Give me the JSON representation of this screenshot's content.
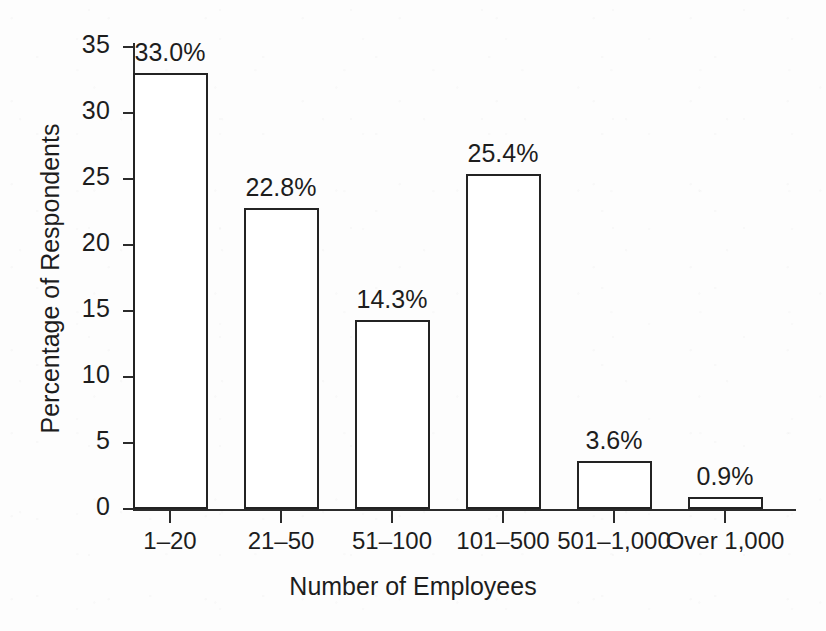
{
  "chart_data": {
    "type": "bar",
    "title": "",
    "xlabel": "Number of Employees",
    "ylabel": "Percentage of Respondents",
    "categories": [
      "1–20",
      "21–50",
      "51–100",
      "101–500",
      "501–1,000",
      "Over 1,000"
    ],
    "values": [
      33.0,
      22.8,
      14.3,
      25.4,
      3.6,
      0.9
    ],
    "value_labels": [
      "33.0%",
      "22.8%",
      "14.3%",
      "25.4%",
      "3.6%",
      "0.9%"
    ],
    "ylim": [
      0,
      35
    ],
    "xlim": null,
    "yticks": [
      0,
      5,
      10,
      15,
      20,
      25,
      30,
      35
    ],
    "ytick_labels": [
      "0",
      "5",
      "10",
      "15",
      "20",
      "25",
      "30",
      "35"
    ],
    "grid": false,
    "legend": null,
    "legend_position": "none",
    "bar_fill": "#ffffff",
    "bar_edge": "#232323",
    "axis_color": "#2b2b2b",
    "text_color": "#1d1d1d",
    "background": "#fdfdfd"
  }
}
